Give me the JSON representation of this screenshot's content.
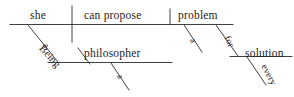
{
  "diagram": {
    "type": "reed-kellogg-sentence-diagram",
    "sentence": "Being a philosopher, she can propose a problem for every solution.",
    "ink_color": "#2b2b2b",
    "background_color": "#ffffff",
    "labels": {
      "subject": "she",
      "verb": "can propose",
      "direct_object": "problem",
      "object_article": "a",
      "gerund": "Being",
      "gerund_article": "a",
      "gerund_object": "philosopher",
      "preposition": "for",
      "prep_object": "solution",
      "prep_determiner": "every"
    },
    "parts": [
      {
        "name": "subject",
        "text": "she"
      },
      {
        "name": "verb",
        "text": "can propose"
      },
      {
        "name": "direct-object",
        "text": "problem"
      },
      {
        "name": "article-a-problem",
        "text": "a"
      },
      {
        "name": "gerund",
        "text": "Being"
      },
      {
        "name": "article-a-philosopher",
        "text": "a"
      },
      {
        "name": "gerund-object",
        "text": "philosopher"
      },
      {
        "name": "preposition-for",
        "text": "for"
      },
      {
        "name": "prep-object",
        "text": "solution"
      },
      {
        "name": "determiner-every",
        "text": "every"
      }
    ]
  }
}
